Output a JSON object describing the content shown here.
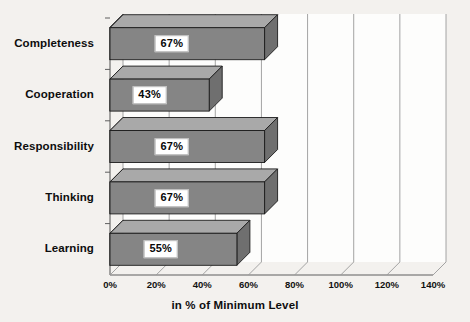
{
  "chart_data": {
    "type": "bar",
    "orientation": "horizontal",
    "style": "3d",
    "title": "",
    "xlabel": "in % of Minimum Level",
    "ylabel": "",
    "categories": [
      "Learning",
      "Thinking",
      "Responsibility",
      "Cooperation",
      "Completeness"
    ],
    "values": [
      55,
      67,
      67,
      43,
      67
    ],
    "value_labels": [
      "55%",
      "67%",
      "67%",
      "43%",
      "67%"
    ],
    "xlim": [
      0,
      140
    ],
    "xticks": [
      0,
      20,
      40,
      60,
      80,
      100,
      120,
      140
    ],
    "xtick_labels": [
      "0%",
      "20%",
      "40%",
      "60%",
      "80%",
      "100%",
      "120%",
      "140%"
    ],
    "grid": true,
    "grid_axis": "x",
    "legend": false,
    "colors": {
      "bar_front": "#858585",
      "bar_top": "#a9a9a9",
      "bar_side": "#6f6f6f",
      "bar_outline": "#1c1c1c",
      "background": "#f3f1ee",
      "wall": "#fdfdfc",
      "grid_line": "#9a9a9a",
      "axis_line": "#5f5f5f",
      "label_box": "#ffffff",
      "text": "#0d0d0d"
    }
  },
  "axis": {
    "title": "in % of Minimum Level"
  }
}
